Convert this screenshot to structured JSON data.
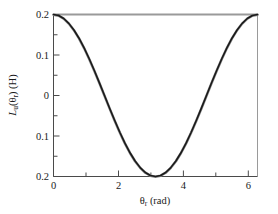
{
  "chart_data": {
    "type": "line",
    "title": "",
    "xlabel": "θr (rad)",
    "ylabel": "Lu(θr) (H)",
    "xlim": [
      0,
      6.2832
    ],
    "ylim": [
      -0.2,
      0.2
    ],
    "grid": false,
    "legend": null,
    "xticks": [
      0,
      2,
      4,
      6
    ],
    "xticklabels": [
      "0",
      "2",
      "4",
      "6"
    ],
    "xminorticks": [
      1,
      3,
      5
    ],
    "yticks": [
      0.2,
      0.1,
      0,
      -0.1,
      -0.2
    ],
    "yticklabels": [
      "0.2",
      "0.1",
      "0",
      "0.1",
      "0.2"
    ],
    "yminorticks": [
      0.15,
      0.05,
      -0.05,
      -0.15
    ],
    "series": [
      {
        "name": "Lu(θr)",
        "color": "#1a1a1a",
        "linewidth": 1.6,
        "x": [
          0,
          0.1571,
          0.3142,
          0.4712,
          0.6283,
          0.7854,
          0.9425,
          1.0996,
          1.2566,
          1.4137,
          1.5708,
          1.7279,
          1.885,
          2.042,
          2.1991,
          2.3562,
          2.5133,
          2.6704,
          2.8274,
          2.9845,
          3.1416,
          3.2987,
          3.4558,
          3.6128,
          3.7699,
          3.927,
          4.0841,
          4.2412,
          4.3982,
          4.5553,
          4.7124,
          4.8695,
          5.0265,
          5.1836,
          5.3407,
          5.4978,
          5.6549,
          5.8119,
          5.969,
          6.1261,
          6.2832
        ],
        "y": [
          0.2,
          0.1976,
          0.1902,
          0.1781,
          0.1618,
          0.1414,
          0.1176,
          0.0908,
          0.0618,
          0.0313,
          0.0,
          -0.0313,
          -0.0618,
          -0.0908,
          -0.1176,
          -0.1414,
          -0.1618,
          -0.1781,
          -0.1902,
          -0.1976,
          -0.2,
          -0.1976,
          -0.1902,
          -0.1781,
          -0.1618,
          -0.1414,
          -0.1176,
          -0.0908,
          -0.0618,
          -0.0313,
          0.0,
          0.0313,
          0.0618,
          0.0908,
          0.1176,
          0.1414,
          0.1618,
          0.1781,
          0.1902,
          0.1976,
          0.2
        ]
      },
      {
        "name": "Lu(θr) overlay",
        "color": "#8a8a8a",
        "linewidth": 2.6,
        "x": [
          0,
          0.1571,
          0.3142,
          0.4712,
          0.6283,
          0.7854,
          0.9425,
          1.0996,
          1.2566,
          1.4137,
          1.5708,
          1.7279,
          1.885,
          2.042,
          2.1991,
          2.3562,
          2.5133,
          2.6704,
          2.8274,
          2.9845,
          3.1416,
          3.2987,
          3.4558,
          3.6128,
          3.7699,
          3.927,
          4.0841,
          4.2412,
          4.3982,
          4.5553,
          4.7124,
          4.8695,
          5.0265,
          5.1836,
          5.3407,
          5.4978,
          5.6549,
          5.8119,
          5.969,
          6.1261,
          6.2832
        ],
        "y": [
          0.1995,
          0.1971,
          0.1897,
          0.1776,
          0.1613,
          0.1409,
          0.1171,
          0.0903,
          0.0613,
          0.0308,
          -0.0005,
          -0.0318,
          -0.0623,
          -0.0913,
          -0.1181,
          -0.1419,
          -0.1623,
          -0.1786,
          -0.1907,
          -0.1981,
          -0.2005,
          -0.1981,
          -0.1907,
          -0.1786,
          -0.1623,
          -0.1419,
          -0.1181,
          -0.0913,
          -0.0623,
          -0.0318,
          -0.0005,
          0.0308,
          0.0613,
          0.0903,
          0.1171,
          0.1409,
          0.1613,
          0.1776,
          0.1897,
          0.1971,
          0.1995
        ]
      }
    ],
    "axis_colors": {
      "left": "#4a4a4a",
      "bottom": "#4a4a4a",
      "top": "#9a9a9a",
      "right": "#9a9a9a"
    }
  }
}
